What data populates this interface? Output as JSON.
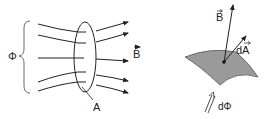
{
  "left_figure": {
    "flux_label": "Φ",
    "field_label": "B",
    "area_label": "A",
    "field_line_count": 5
  },
  "right_figure": {
    "field_label": "B",
    "area_vector_label": "dA",
    "flux_element_label": "dΦ",
    "surface_color": "#9a9a9a"
  },
  "colors": {
    "line": "#222222",
    "surface": "#9a9a9a",
    "background": "#ffffff"
  }
}
